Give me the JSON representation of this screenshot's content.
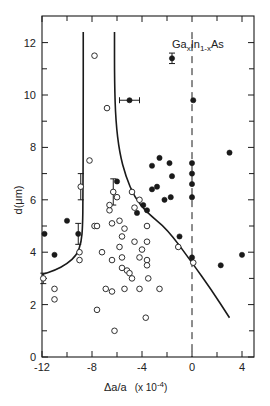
{
  "chart_data": {
    "type": "scatter",
    "title": "",
    "annotation": {
      "text": "GaxIn1-xAs",
      "base1": "Ga",
      "sub1": "x",
      "base2": "In",
      "sub2": "1-x",
      "base3": "As"
    },
    "xlabel": "Δa/a  (x 10⁻⁴)",
    "xlabel_main": "Δa/a",
    "xlabel_scale": "(x 10",
    "xlabel_exp": "-4",
    "xlabel_close": ")",
    "ylabel": "d(μm)",
    "xlim": [
      -12,
      5
    ],
    "ylim": [
      0,
      13
    ],
    "x_ticks": [
      -12,
      -8,
      -4,
      0,
      4
    ],
    "x_tick_labels": [
      "-12",
      "-8",
      "-4",
      "0",
      "4"
    ],
    "x_minor_ticks": [
      -10,
      -6,
      -2,
      2
    ],
    "y_ticks": [
      0,
      2,
      4,
      6,
      8,
      10,
      12
    ],
    "y_tick_labels": [
      "0",
      "2",
      "4",
      "6",
      "8",
      "10",
      "12"
    ],
    "y_minor_ticks": [
      1,
      3,
      5,
      7,
      9,
      11
    ],
    "grid": false,
    "legend": null,
    "reference_line": {
      "x": 0,
      "style": "dashed",
      "y_range": [
        0,
        12.4
      ]
    },
    "series": [
      {
        "name": "solid points",
        "marker": "filled-circle",
        "points": [
          [
            -11.8,
            4.7
          ],
          [
            -11.0,
            3.9
          ],
          [
            -10.0,
            5.2
          ],
          [
            -9.1,
            4.7
          ],
          [
            -5.0,
            9.8
          ],
          [
            -1.6,
            11.4
          ],
          [
            0.1,
            9.8
          ],
          [
            -6.0,
            6.7
          ],
          [
            -3.2,
            7.3
          ],
          [
            -2.6,
            7.6
          ],
          [
            -1.8,
            7.4
          ],
          [
            -2.2,
            6.0
          ],
          [
            -3.2,
            6.4
          ],
          [
            -2.8,
            6.5
          ],
          [
            -1.6,
            6.9
          ],
          [
            -1.7,
            6.1
          ],
          [
            -3.6,
            5.6
          ],
          [
            -3.9,
            5.8
          ],
          [
            -4.4,
            5.5
          ],
          [
            0.0,
            7.4
          ],
          [
            0.0,
            7.0
          ],
          [
            0.0,
            6.6
          ],
          [
            0.0,
            6.1
          ],
          [
            0.0,
            3.8
          ],
          [
            -1.0,
            4.6
          ],
          [
            3.0,
            7.8
          ],
          [
            2.3,
            3.5
          ],
          [
            4.0,
            3.9
          ]
        ],
        "error_bars": [
          {
            "point": [
              -5.0,
              9.8
            ],
            "x_err": 0.8
          },
          {
            "point": [
              -1.6,
              11.4
            ],
            "y_err": 0.2
          },
          {
            "point": [
              -9.1,
              4.7
            ],
            "y_err": 0.4
          }
        ]
      },
      {
        "name": "open points",
        "marker": "open-circle",
        "points": [
          [
            -11.9,
            3.0
          ],
          [
            -11.0,
            2.6
          ],
          [
            -11.0,
            2.2
          ],
          [
            -9.0,
            4.0
          ],
          [
            -9.0,
            3.7
          ],
          [
            -8.9,
            6.5
          ],
          [
            -8.2,
            7.5
          ],
          [
            -7.8,
            5.0
          ],
          [
            -7.6,
            5.0
          ],
          [
            -7.8,
            11.5
          ],
          [
            -6.8,
            9.5
          ],
          [
            -7.2,
            4.0
          ],
          [
            -6.2,
            1.0
          ],
          [
            -7.6,
            1.8
          ],
          [
            -6.9,
            2.6
          ],
          [
            -6.4,
            2.5
          ],
          [
            -6.3,
            6.3
          ],
          [
            -6.6,
            5.6
          ],
          [
            -6.6,
            5.8
          ],
          [
            -6.0,
            6.1
          ],
          [
            -6.4,
            5.1
          ],
          [
            -5.8,
            5.2
          ],
          [
            -5.6,
            4.6
          ],
          [
            -5.4,
            4.9
          ],
          [
            -5.8,
            4.2
          ],
          [
            -5.6,
            3.8
          ],
          [
            -6.4,
            3.7
          ],
          [
            -5.6,
            3.4
          ],
          [
            -5.2,
            3.3
          ],
          [
            -5.0,
            3.2
          ],
          [
            -4.8,
            3.0
          ],
          [
            -5.4,
            2.6
          ],
          [
            -4.6,
            4.4
          ],
          [
            -4.0,
            4.1
          ],
          [
            -4.2,
            3.8
          ],
          [
            -3.6,
            3.7
          ],
          [
            -3.6,
            3.5
          ],
          [
            -3.5,
            3.0
          ],
          [
            -4.2,
            2.6
          ],
          [
            -2.6,
            2.6
          ],
          [
            -3.7,
            1.5
          ],
          [
            -4.6,
            5.7
          ],
          [
            -4.2,
            6.0
          ],
          [
            -3.6,
            4.4
          ],
          [
            -3.6,
            5.0
          ],
          [
            -4.8,
            6.3
          ],
          [
            -1.1,
            4.2
          ],
          [
            0.1,
            3.6
          ]
        ],
        "error_bars": [
          {
            "point": [
              -8.9,
              6.5
            ],
            "y_err": 0.5
          },
          {
            "point": [
              -6.3,
              6.3
            ],
            "y_err": 0.5
          },
          {
            "point": [
              -11.9,
              3.0
            ],
            "y_err": 0.2
          }
        ]
      }
    ],
    "curves": [
      {
        "name": "left boundary curve",
        "style": "solid",
        "points": [
          [
            -8.7,
            12.4
          ],
          [
            -8.7,
            9.0
          ],
          [
            -8.72,
            6.0
          ],
          [
            -8.75,
            5.0
          ],
          [
            -8.85,
            4.4
          ],
          [
            -9.2,
            3.9
          ],
          [
            -10.0,
            3.55
          ],
          [
            -11.0,
            3.3
          ],
          [
            -12.0,
            3.15
          ]
        ]
      },
      {
        "name": "right boundary curve",
        "style": "solid",
        "points": [
          [
            -6.2,
            12.4
          ],
          [
            -6.2,
            10.5
          ],
          [
            -6.1,
            9.0
          ],
          [
            -5.8,
            7.8
          ],
          [
            -5.3,
            6.9
          ],
          [
            -4.6,
            6.1
          ],
          [
            -3.6,
            5.5
          ],
          [
            -2.0,
            4.9
          ],
          [
            0.0,
            3.6
          ],
          [
            1.5,
            2.6
          ],
          [
            3.0,
            1.5
          ]
        ]
      }
    ]
  },
  "plot_geometry": {
    "frame": {
      "left": 42,
      "top": 16,
      "right": 254,
      "bottom": 357
    },
    "x0_px": 192,
    "x_scale": 12.5,
    "y0_px": 357,
    "y_scale": 26.2
  }
}
